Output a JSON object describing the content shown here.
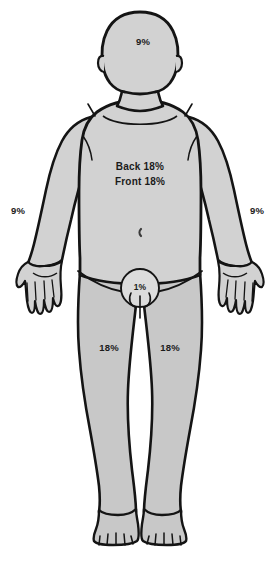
{
  "diagram": {
    "colors": {
      "outline": "#141414",
      "skin_fill": "#d2d2d2",
      "limb_fill": "#c8c8c8",
      "genital_fill": "#dcdcdc",
      "background": "#ffffff",
      "label_text": "#1b1b1b"
    },
    "regions": [
      {
        "id": "head",
        "label": "9%",
        "x": 143,
        "y": 42
      },
      {
        "id": "right-arm",
        "label": "9%",
        "x": 18,
        "y": 211
      },
      {
        "id": "left-arm",
        "label": "9%",
        "x": 257,
        "y": 211
      },
      {
        "id": "torso-back",
        "label": "Back 18%",
        "x": 140,
        "y": 167
      },
      {
        "id": "torso-front",
        "label": "Front 18%",
        "x": 140,
        "y": 182
      },
      {
        "id": "genitals",
        "label": "1%",
        "x": 140,
        "y": 288
      },
      {
        "id": "right-leg",
        "label": "18%",
        "x": 109,
        "y": 348
      },
      {
        "id": "left-leg",
        "label": "18%",
        "x": 170,
        "y": 348
      }
    ]
  }
}
